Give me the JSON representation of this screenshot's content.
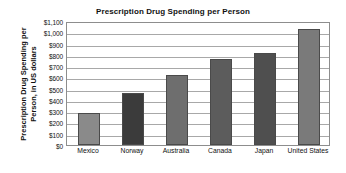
{
  "chart_data": {
    "type": "bar",
    "title": "Prescription Drug Spending per Person",
    "xlabel": "",
    "ylabel": "Prescription Drug Spending per Person, in US dollars",
    "ylabel_lines": [
      "Prescription Drug Spending per",
      "Person, in US dollars"
    ],
    "categories": [
      "Mexico",
      "Norway",
      "Australia",
      "Canada",
      "Japan",
      "United States"
    ],
    "values": [
      280,
      460,
      620,
      765,
      815,
      1030
    ],
    "ylim": [
      0,
      1100
    ],
    "ytick_values": [
      0,
      100,
      200,
      300,
      400,
      500,
      600,
      700,
      800,
      900,
      1000,
      1100
    ],
    "ytick_labels": [
      "$0",
      "$100",
      "$200",
      "$300",
      "$400",
      "$500",
      "$600",
      "$700",
      "$800",
      "$900",
      "$1,000",
      "$1,100"
    ],
    "grid": true,
    "legend": false,
    "bar_colors": [
      "#8a8a8a",
      "#3b3b3b",
      "#6e6e6e",
      "#5c5c5c",
      "#4f4f4f",
      "#7a7a7a"
    ],
    "axis_color": "#8d8d8d",
    "grid_color": "#a8a8a8",
    "background": "#ffffff",
    "text_color": "#111111"
  }
}
